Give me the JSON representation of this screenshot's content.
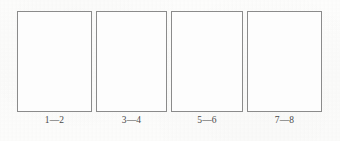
{
  "figure": {
    "background_color": "#fdfdfc",
    "border_color": "#8b8b8b",
    "caption_color": "#4a4a4a",
    "panels": [
      {
        "caption": "1—2",
        "box_content": ""
      },
      {
        "caption": "3—4",
        "box_content": ""
      },
      {
        "caption": "5—6",
        "box_content": ""
      },
      {
        "caption": "7—8",
        "box_content": ""
      }
    ]
  }
}
